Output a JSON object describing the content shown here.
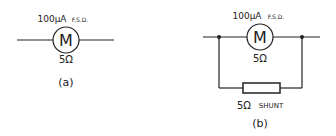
{
  "diagram_a": {
    "meter_symbol": "M",
    "rating": "100µA",
    "rating_suffix": "F.S.D.",
    "resistance": "5Ω",
    "caption": "(a)"
  },
  "diagram_b": {
    "meter_symbol": "M",
    "rating": "100µA",
    "rating_suffix": "F.S.D.",
    "resistance": "5Ω",
    "shunt_value": "5Ω",
    "shunt_label": "SHUNT",
    "caption": "(b)"
  },
  "colors": {
    "line": "#222222",
    "background": "#ffffff"
  }
}
